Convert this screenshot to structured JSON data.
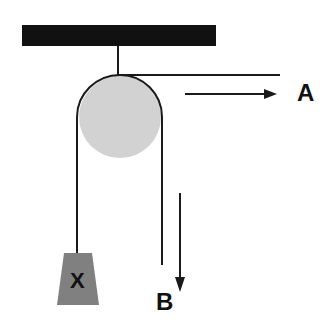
{
  "diagram": {
    "type": "pulley",
    "labels": {
      "rope_end_a": "A",
      "rope_end_b": "B",
      "weight": "X"
    },
    "colors": {
      "ceiling": "#111111",
      "wheel": "#d2d2d2",
      "rope": "#1a1a1a",
      "weight": "#808080",
      "background": "#ffffff"
    },
    "arrows": [
      {
        "id": "A",
        "direction": "right"
      },
      {
        "id": "B",
        "direction": "down"
      }
    ]
  }
}
